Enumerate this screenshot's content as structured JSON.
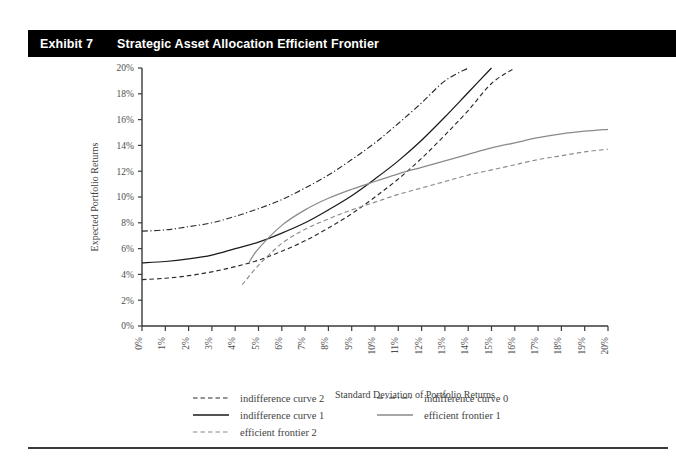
{
  "header": {
    "exhibit_label": "Exhibit 7",
    "title": "Strategic Asset Allocation Efficient Frontier"
  },
  "chart_data": {
    "type": "line",
    "title": "Strategic Asset Allocation Efficient Frontier",
    "xlabel": "Standard Deviation of Portfolio Returns",
    "ylabel": "Expected Portfolio Returns",
    "xlim": [
      0,
      20
    ],
    "ylim": [
      0,
      20
    ],
    "xtick_step": 1,
    "ytick_step": 2,
    "grid": false,
    "legend_position": "below",
    "x_ticks": [
      "0%",
      "1%",
      "2%",
      "3%",
      "4%",
      "5%",
      "6%",
      "7%",
      "8%",
      "9%",
      "10%",
      "11%",
      "12%",
      "13%",
      "14%",
      "15%",
      "16%",
      "17%",
      "18%",
      "19%",
      "20%"
    ],
    "y_ticks": [
      "0%",
      "2%",
      "4%",
      "6%",
      "8%",
      "10%",
      "12%",
      "14%",
      "16%",
      "18%",
      "20%"
    ],
    "series": [
      {
        "name": "indifference curve 2",
        "style": "dashed",
        "color": "#2b2b2b",
        "x": [
          0,
          1,
          2,
          3,
          4,
          5,
          6,
          7,
          8,
          9,
          10,
          11,
          12,
          13,
          14,
          15,
          16
        ],
        "y": [
          3.6,
          3.7,
          3.9,
          4.2,
          4.6,
          5.1,
          5.8,
          6.6,
          7.6,
          8.7,
          10.0,
          11.4,
          13.0,
          14.8,
          16.7,
          18.8,
          20.0
        ]
      },
      {
        "name": "indifference curve 1",
        "style": "solid",
        "color": "#1a1a1a",
        "x": [
          0,
          1,
          2,
          3,
          4,
          5,
          6,
          7,
          8,
          9,
          10,
          11,
          12,
          13,
          14,
          15
        ],
        "y": [
          4.9,
          5.0,
          5.2,
          5.5,
          6.0,
          6.5,
          7.2,
          8.0,
          9.0,
          10.1,
          11.4,
          12.8,
          14.4,
          16.2,
          18.1,
          20.0
        ]
      },
      {
        "name": "indifference curve 0",
        "style": "dash-dot",
        "color": "#2b2b2b",
        "x": [
          0,
          1,
          2,
          3,
          4,
          5,
          6,
          7,
          8,
          9,
          10,
          11,
          12,
          13,
          14
        ],
        "y": [
          7.35,
          7.45,
          7.7,
          8.0,
          8.5,
          9.1,
          9.8,
          10.7,
          11.7,
          12.9,
          14.2,
          15.7,
          17.3,
          19.0,
          20.0
        ]
      },
      {
        "name": "efficient frontier 1",
        "style": "solid",
        "color": "#8a8a8a",
        "x": [
          4.6,
          5,
          6,
          7,
          8,
          9,
          10,
          11,
          12,
          13,
          14,
          15,
          16,
          17,
          18,
          19,
          20
        ],
        "y": [
          4.95,
          6.0,
          7.8,
          9.0,
          9.9,
          10.6,
          11.2,
          11.8,
          12.3,
          12.8,
          13.3,
          13.8,
          14.2,
          14.6,
          14.9,
          15.1,
          15.25
        ]
      },
      {
        "name": "efficient frontier 2",
        "style": "dashed",
        "color": "#8a8a8a",
        "x": [
          4.3,
          5,
          6,
          7,
          8,
          9,
          10,
          11,
          12,
          13,
          14,
          15,
          16,
          17,
          18,
          19,
          20
        ],
        "y": [
          3.2,
          4.7,
          6.4,
          7.5,
          8.3,
          9.0,
          9.6,
          10.2,
          10.7,
          11.2,
          11.7,
          12.1,
          12.5,
          12.9,
          13.2,
          13.5,
          13.7
        ]
      }
    ]
  },
  "legend": {
    "items": [
      {
        "label": "indifference curve 2",
        "style": "dashed",
        "color": "#2b2b2b"
      },
      {
        "label": "indifference curve 0",
        "style": "dash-dot",
        "color": "#2b2b2b"
      },
      {
        "label": "indifference curve 1",
        "style": "solid",
        "color": "#1a1a1a"
      },
      {
        "label": "efficient frontier 1",
        "style": "solid",
        "color": "#8a8a8a"
      },
      {
        "label": "efficient frontier 2",
        "style": "dashed",
        "color": "#8a8a8a"
      }
    ]
  }
}
